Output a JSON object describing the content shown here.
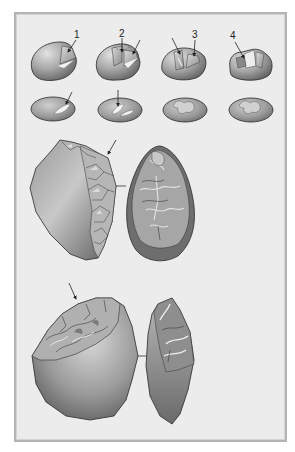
{
  "figure": {
    "step_labels": [
      "1",
      "2",
      "3",
      "4"
    ],
    "colors": {
      "page_background": "#ffffff",
      "panel_background": "#ececec",
      "panel_border": "#b4b4b4",
      "stone_light": "#d6d6d6",
      "stone_mid": "#9a9a9a",
      "stone_dark": "#5a5a5a",
      "outline": "#2a2a2a",
      "scar_highlight": "#f2f2f2"
    },
    "rows": [
      {
        "name": "pebble-side-views",
        "count": 4
      },
      {
        "name": "pebble-top-views",
        "count": 4
      },
      {
        "name": "core-and-flake-large-1",
        "count": 2
      },
      {
        "name": "core-and-flake-large-2",
        "count": 2
      }
    ]
  }
}
